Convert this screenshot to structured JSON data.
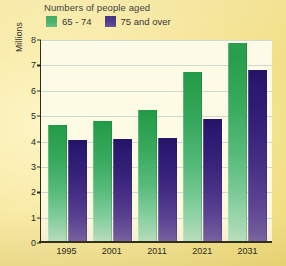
{
  "chart_data": {
    "type": "bar",
    "title": "Numbers of people aged",
    "xlabel": "",
    "ylabel": "Millions",
    "ylim": [
      0,
      8
    ],
    "yticks": [
      0,
      1,
      2,
      3,
      4,
      5,
      6,
      7,
      8
    ],
    "grid": true,
    "legend_position": "top-left",
    "categories": [
      "1995",
      "2001",
      "2011",
      "2021",
      "2031"
    ],
    "series": [
      {
        "name": "65 - 74",
        "color": "#2aa04e",
        "values": [
          4.65,
          4.8,
          5.25,
          6.75,
          7.9
        ]
      },
      {
        "name": "75 and over",
        "color": "#2b1a72",
        "values": [
          4.05,
          4.1,
          4.15,
          4.9,
          6.8
        ]
      }
    ]
  },
  "figure": {
    "title": "Numbers of people aged",
    "y_axis_title": "Millions",
    "background_color": "#f3e28d",
    "plot_background_color": "#fdfbe4",
    "gridline_color": "#cfd8d0",
    "axis_color": "#2c2a18"
  },
  "legend": {
    "items": [
      {
        "label": "65 - 74",
        "swatch": "green-swatch"
      },
      {
        "label": "75 and over",
        "swatch": "purple-swatch"
      }
    ]
  },
  "y_ticks": [
    "8",
    "7",
    "6",
    "5",
    "4",
    "3",
    "2",
    "1",
    "0"
  ],
  "x_ticks": [
    "1995",
    "2001",
    "2011",
    "2021",
    "2031"
  ]
}
